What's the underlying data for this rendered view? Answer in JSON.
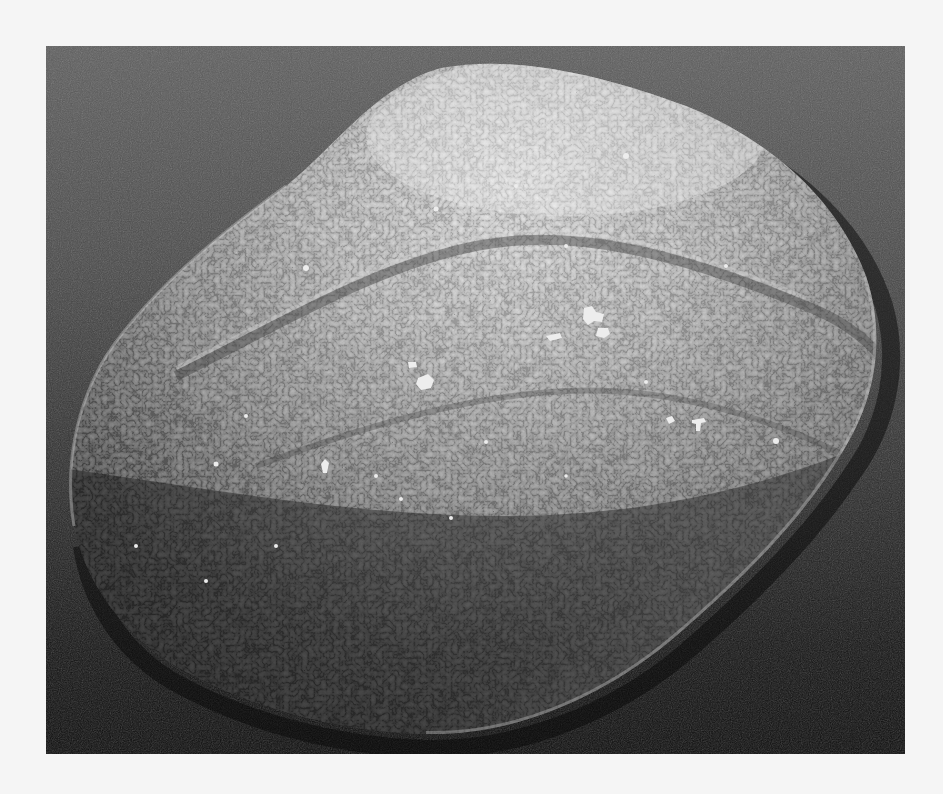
{
  "figure": {
    "kind": "scanning electron micrograph",
    "color_mode": "grayscale",
    "background_color": "#f5f5f5",
    "frame": {
      "x": 46,
      "y": 46,
      "width": 859,
      "height": 708
    },
    "substrate_colors": {
      "top": "#5e5e5e",
      "middle": "#2e2e2e",
      "bottom": "#0c0c0c"
    },
    "seed_colors": {
      "highlight": "#e6e6e6",
      "mid": "#9a9a9a",
      "shadow": "#2a2a2a"
    },
    "features": [
      "ovoid seed body tilted diagonally",
      "reticulate (honeycomb) surface texture",
      "longitudinal groove running from upper-left to right",
      "scattered debris particles on surface",
      "bright rim highlight along lower-right edge"
    ]
  }
}
